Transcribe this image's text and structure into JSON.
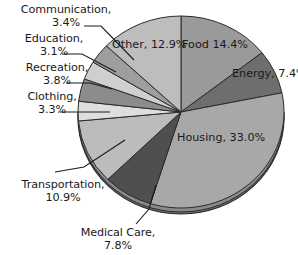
{
  "chart_data": {
    "type": "pie",
    "title": "",
    "subtitle": "",
    "xlabel": "",
    "ylabel": "",
    "legend_position": "none",
    "grid": false,
    "units": "percent",
    "categories": [
      "Food",
      "Energy",
      "Housing",
      "Medical Care",
      "Transportation",
      "Clothing",
      "Recreation",
      "Education",
      "Communication",
      "Other"
    ],
    "values": [
      14.4,
      7.4,
      33.0,
      7.8,
      10.9,
      3.3,
      3.8,
      3.1,
      3.4,
      12.9
    ],
    "slices": [
      {
        "label": "Food",
        "value": 14.4,
        "value_text": "14.4%",
        "color": "#9a9a9a",
        "label_placement": "inside",
        "start_deg": 0.0,
        "end_deg": 51.84
      },
      {
        "label": "Energy",
        "value": 7.4,
        "value_text": "7.4%",
        "color": "#6e6e6e",
        "label_placement": "inside",
        "start_deg": 51.84,
        "end_deg": 78.48
      },
      {
        "label": "Housing",
        "value": 33.0,
        "value_text": "33.0%",
        "color": "#a8a8a8",
        "label_placement": "inside",
        "start_deg": 78.48,
        "end_deg": 197.28
      },
      {
        "label": "Medical Care",
        "value": 7.8,
        "value_text": "7.8%",
        "color": "#4f4f4f",
        "label_placement": "outside",
        "start_deg": 197.28,
        "end_deg": 225.36
      },
      {
        "label": "Transportation",
        "value": 10.9,
        "value_text": "10.9%",
        "color": "#bcbcbc",
        "label_placement": "outside",
        "start_deg": 225.36,
        "end_deg": 264.6
      },
      {
        "label": "Clothing",
        "value": 3.3,
        "value_text": "3.3%",
        "color": "#dedede",
        "label_placement": "outside",
        "start_deg": 264.6,
        "end_deg": 276.48
      },
      {
        "label": "Recreation",
        "value": 3.8,
        "value_text": "3.8%",
        "color": "#8c8c8c",
        "label_placement": "outside",
        "start_deg": 276.48,
        "end_deg": 290.16
      },
      {
        "label": "Education",
        "value": 3.1,
        "value_text": "3.1%",
        "color": "#cfcfcf",
        "label_placement": "outside",
        "start_deg": 290.16,
        "end_deg": 301.32
      },
      {
        "label": "Communication",
        "value": 3.4,
        "value_text": "3.4%",
        "color": "#9e9e9e",
        "label_placement": "outside",
        "start_deg": 301.32,
        "end_deg": 313.56
      },
      {
        "label": "Other",
        "value": 12.9,
        "value_text": "12.9%",
        "color": "#bdbdbd",
        "label_placement": "inside",
        "start_deg": 313.56,
        "end_deg": 360.0
      }
    ],
    "colors": {
      "outline": "#2b2b2b",
      "rim": "#8f8f8f",
      "rim_shadow": "#6b6b6b",
      "background": "#ffffff",
      "text": "#1a1a1a",
      "leader_line": "#1a1a1a"
    }
  },
  "labels": {
    "communication": {
      "name": "Communication,",
      "pct": "3.4%"
    },
    "education": {
      "name": "Education,",
      "pct": "3.1%"
    },
    "recreation": {
      "name": "Recreation,",
      "pct": "3.8%"
    },
    "clothing": {
      "name": "Clothing,",
      "pct": "3.3%"
    },
    "transportation": {
      "name": "Transportation,",
      "pct": "10.9%"
    },
    "medical_care": {
      "name": "Medical Care,",
      "pct": "7.8%"
    },
    "other": {
      "name": "Other,",
      "pct": "12.9%"
    },
    "food": {
      "name": "Food",
      "pct": "14.4%"
    },
    "energy": {
      "name": "Energy,",
      "pct": "7.4%"
    },
    "housing": {
      "name": "Housing,",
      "pct": "33.0%"
    }
  }
}
